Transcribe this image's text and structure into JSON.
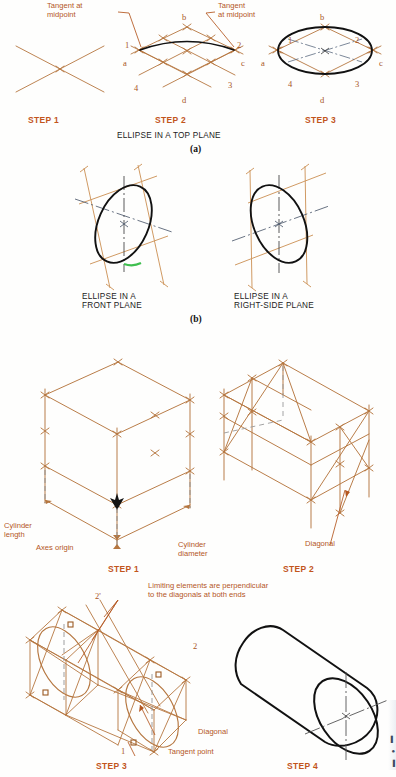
{
  "page": {
    "background_color": "#fefefd",
    "construction_line_color": "#b5763f",
    "object_line_color": "#111111",
    "step_label_color": "#c2551c",
    "callout_color": "#b4561f",
    "accent_green": "#3fbf4f"
  },
  "section_a": {
    "caption": "ELLIPSE IN A TOP PLANE",
    "sublabel": "(a)",
    "callouts": [
      {
        "id": "tangent-left",
        "text": "Tangent at\nmidpoint"
      },
      {
        "id": "tangent-right",
        "text": "Tangent\nat midpoint"
      }
    ],
    "steps": [
      {
        "label": "STEP 1",
        "point_labels": []
      },
      {
        "label": "STEP 2",
        "point_labels": [
          "a",
          "b",
          "c",
          "d",
          "1",
          "2",
          "3",
          "4"
        ]
      },
      {
        "label": "STEP 3",
        "point_labels": [
          "a",
          "b",
          "c",
          "d",
          "1",
          "2",
          "3",
          "4"
        ]
      }
    ]
  },
  "section_b": {
    "sublabel": "(b)",
    "figures": [
      {
        "id": "front-plane",
        "caption": "ELLIPSE IN A\nFRONT PLANE"
      },
      {
        "id": "right-side-plane",
        "caption": "ELLIPSE IN A\nRIGHT-SIDE PLANE"
      }
    ]
  },
  "section_c": {
    "steps": [
      {
        "label": "STEP 1",
        "callouts": [
          {
            "id": "cylinder-length",
            "text": "Cylinder\nlength"
          },
          {
            "id": "axes-origin",
            "text": "Axes origin"
          },
          {
            "id": "cylinder-diameter",
            "text": "Cylinder\ndiameter"
          }
        ]
      },
      {
        "label": "STEP 2",
        "callouts": [
          {
            "id": "diagonal",
            "text": "Diagonal"
          }
        ]
      },
      {
        "label": "STEP 3",
        "callouts": [
          {
            "id": "limiting-elements",
            "text": "Limiting elements are perpendicular\nto the diagonals at both ends"
          },
          {
            "id": "diagonal",
            "text": "Diagonal"
          },
          {
            "id": "tangent-point",
            "text": "Tangent point"
          }
        ],
        "point_labels": [
          "2'",
          "2",
          "1"
        ]
      },
      {
        "label": "STEP 4",
        "callouts": []
      }
    ]
  }
}
